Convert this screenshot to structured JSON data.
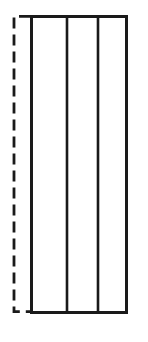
{
  "canvas": {
    "width": 148,
    "height": 342,
    "background_color": "#ffffff",
    "description": "Technical line drawing of a tall rectangular panel divided into three vertical bays, with a dashed reference bracket on the left side"
  },
  "style": {
    "stroke_color": "#1a1a1a",
    "fill_color": "#ffffff",
    "outline_stroke_width": 3,
    "divider_stroke_width": 2.6,
    "dashed_stroke_width": 2.8,
    "dash_pattern": "11 6"
  },
  "figure": {
    "outline": {
      "name": "panel-outline",
      "x": 30,
      "y": 15,
      "width": 98,
      "height": 299
    },
    "dividers": [
      {
        "name": "divider-1",
        "x": 67,
        "y_top": 15,
        "y_bottom": 314
      },
      {
        "name": "divider-2",
        "x": 98,
        "y_top": 15,
        "y_bottom": 314
      }
    ],
    "bays": [
      {
        "name": "bay-left",
        "x": 30,
        "width": 37
      },
      {
        "name": "bay-center",
        "x": 67,
        "width": 31
      },
      {
        "name": "bay-right",
        "x": 98,
        "width": 30
      }
    ],
    "reference_bracket": {
      "name": "dashed-reference-bracket",
      "vertical_x": 14,
      "y_top": 15,
      "y_bottom": 313,
      "top_stub_x_end": 30,
      "bottom_stub_x_end": 32
    }
  }
}
